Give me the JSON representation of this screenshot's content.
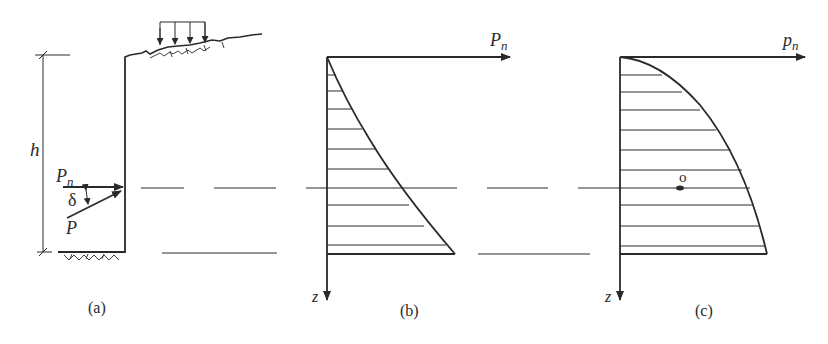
{
  "figure": {
    "panels": [
      {
        "id": "a",
        "caption": "(a)",
        "description": "Retaining wall of height h with surcharge load on backfill; earth pressure resultant P inclined at angle delta to its normal component Pn"
      },
      {
        "id": "b",
        "caption": "(b)",
        "description": "Pressure distribution Pn along depth z, concave increasing curve"
      },
      {
        "id": "c",
        "caption": "(c)",
        "description": "Pressure distribution pn along depth z, convex curve with centroid point o"
      }
    ],
    "labels": {
      "height": "h",
      "normal_force_main": "P",
      "normal_force_sub": "n",
      "angle": "δ",
      "resultant": "P",
      "axis_b_x_main": "P",
      "axis_b_x_sub": "n",
      "axis_b_y": "z",
      "axis_c_x_main": "p",
      "axis_c_x_sub": "n",
      "axis_c_y": "z",
      "centroid": "o",
      "caption_a": "(a)",
      "caption_b": "(b)",
      "caption_c": "(c)"
    },
    "colors": {
      "ink": "#2a2a2a",
      "background": "#ffffff"
    }
  }
}
